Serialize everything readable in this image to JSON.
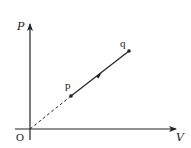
{
  "diagram": {
    "type": "pv-diagram",
    "axes": {
      "y_label": "P",
      "x_label": "V",
      "origin_label": "O"
    },
    "points": [
      {
        "id": "p",
        "label": "p"
      },
      {
        "id": "q",
        "label": "q"
      }
    ],
    "segments": [
      {
        "from": "O",
        "to": "p",
        "style": "dashed"
      },
      {
        "from": "p",
        "to": "q",
        "style": "solid",
        "direction_arrow": "p-to-q"
      }
    ],
    "colors": {
      "line": "#222222",
      "background": "#ffffff"
    }
  }
}
